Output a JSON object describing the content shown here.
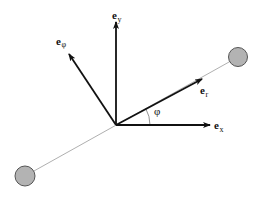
{
  "diagram": {
    "labels": {
      "e_y": {
        "base": "e",
        "sub": "y"
      },
      "e_phi": {
        "base": "e",
        "sub": "φ"
      },
      "e_r": {
        "base": "e",
        "sub": "r"
      },
      "e_x": {
        "base": "e",
        "sub": "x"
      },
      "angle": "φ"
    },
    "colors": {
      "arrow": "#111111",
      "rod": "#9a9a9a",
      "mass_fill": "#b3b3b3",
      "mass_stroke": "#555555",
      "background": "#ffffff"
    },
    "geometry": {
      "origin": [
        116,
        125
      ],
      "masses": [
        {
          "cx": 238,
          "cy": 57,
          "r": 9.5
        },
        {
          "cx": 25,
          "cy": 176,
          "r": 10
        }
      ],
      "angle_arc_radius": 34
    }
  }
}
